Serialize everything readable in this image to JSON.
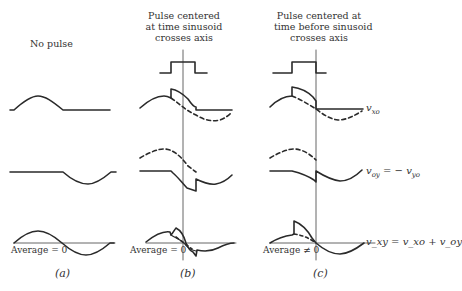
{
  "columns": [
    {
      "id": "a",
      "header": [
        "No pulse"
      ],
      "caption": "(a)",
      "average_label": "Average = 0"
    },
    {
      "id": "b",
      "header": [
        "Pulse centered",
        "at time sinusoid",
        "crosses axis"
      ],
      "caption": "(b)",
      "average_label": "Average = 0"
    },
    {
      "id": "c",
      "header": [
        "Pulse centered at",
        "time before sinusoid",
        "crosses axis"
      ],
      "caption": "(c)",
      "average_label": "Average ≠ 0"
    }
  ],
  "signals": {
    "row1": {
      "name": "v",
      "subscript": "xo",
      "label": "v_xo"
    },
    "row2": {
      "name": "v",
      "subscript": "oy",
      "rhs_name": "v",
      "rhs_subscript": "yo",
      "label": "v_oy = − v_yo"
    },
    "row3": {
      "name": "v",
      "subscript": "xy",
      "rhs": "v_xo + v_oy",
      "label": "v_xy = v_xo + v_oy"
    }
  },
  "colors": {
    "line": "#2a2a2a",
    "axis": "#555555"
  }
}
